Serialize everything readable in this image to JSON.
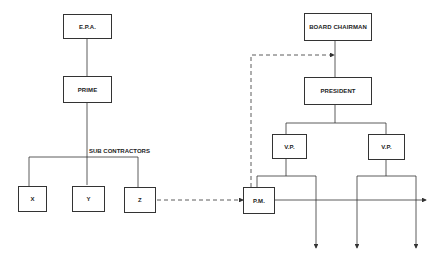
{
  "diagram": {
    "left_org": {
      "top": "E.P.A.",
      "prime": "PRIME",
      "sub_label": "SUB CONTRACTORS",
      "subs": [
        "X",
        "Y",
        "Z"
      ]
    },
    "right_org": {
      "top": "BOARD CHAIRMAN",
      "president": "PRESIDENT",
      "vps": [
        "V.P.",
        "V.P."
      ],
      "pm": "P.M."
    },
    "colors": {
      "line": "#333333",
      "background": "#ffffff"
    }
  }
}
